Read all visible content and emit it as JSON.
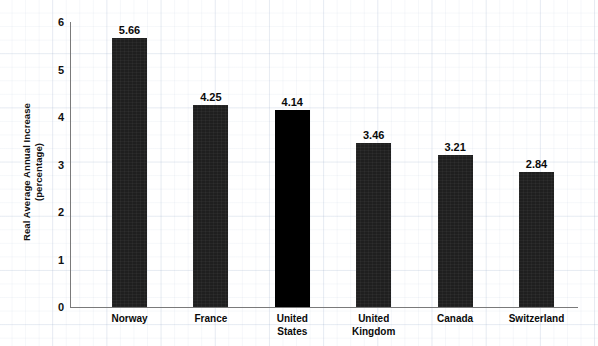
{
  "chart_data": {
    "type": "bar",
    "title": "",
    "xlabel": "",
    "ylabel": "Real Average Annual Increase",
    "ylabel_line2": "(percentage)",
    "ylim": [
      0,
      6
    ],
    "yticks": [
      "6",
      "5",
      "4",
      "3",
      "2",
      "1",
      "0"
    ],
    "grid": true,
    "legend": "none",
    "categories": [
      "Norway",
      "France",
      "United States",
      "United Kingdom",
      "Canada",
      "Switzerland"
    ],
    "category_lines": [
      [
        "Norway"
      ],
      [
        "France"
      ],
      [
        "United",
        "States"
      ],
      [
        "United",
        "Kingdom"
      ],
      [
        "Canada"
      ],
      [
        "Switzerland"
      ]
    ],
    "values": [
      5.66,
      4.25,
      4.14,
      3.46,
      3.21,
      2.84
    ],
    "value_labels": [
      "5.66",
      "4.25",
      "4.14",
      "3.46",
      "3.21",
      "2.84"
    ],
    "highlight_index": 2,
    "colors": {
      "bar": "#1f1f1f",
      "bar_highlight": "#000000",
      "axis": "#7a7a7a",
      "text": "#0a0a0a",
      "grid": "#c3cee0",
      "background": "#ffffff"
    }
  }
}
